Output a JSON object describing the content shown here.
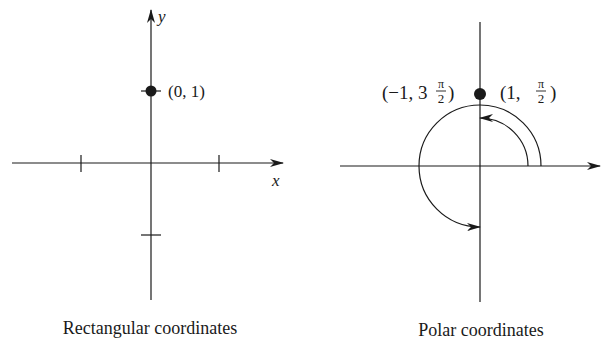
{
  "rectangular": {
    "caption": "Rectangular coordinates",
    "x_axis_label": "x",
    "y_axis_label": "y",
    "point": {
      "x": 0,
      "y": 1
    },
    "point_label": "(0, 1)",
    "ticks": {
      "x": [
        -1,
        1
      ],
      "y": [
        -1,
        1
      ]
    }
  },
  "polar": {
    "caption": "Polar coordinates",
    "point_label_right": {
      "open": "(1, ",
      "num": "π",
      "den": "2",
      "close": ")"
    },
    "point_label_left": {
      "open": "(−1, 3",
      "num": "π",
      "den": "2",
      "close": ")"
    },
    "representations": [
      {
        "r": 1,
        "theta": "π/2",
        "arc": "inner, counterclockwise from 0 to π/2"
      },
      {
        "r": -1,
        "theta": "3π/2",
        "arc": "outer, counterclockwise from 0 to 3π/2"
      }
    ]
  },
  "colors": {
    "ink": "#1a1a1a",
    "background": "#ffffff"
  }
}
